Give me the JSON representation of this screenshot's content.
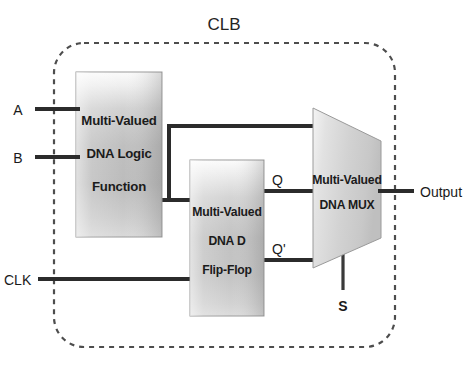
{
  "diagram": {
    "title": "CLB",
    "type": "block-diagram",
    "boundary": {
      "style": "dashed-rounded-rectangle",
      "label": "CLB"
    },
    "blocks": [
      {
        "id": "logic-function",
        "shape": "rectangle",
        "lines": [
          "Multi-Valued",
          "DNA Logic",
          "Function"
        ],
        "line1": "Multi-Valued",
        "line2": "DNA Logic",
        "line3": "Function"
      },
      {
        "id": "d-flip-flop",
        "shape": "rectangle",
        "lines": [
          "Multi-Valued",
          "DNA D",
          "Flip-Flop"
        ],
        "line1": "Multi-Valued",
        "line2": "DNA D",
        "line3": "Flip-Flop"
      },
      {
        "id": "dna-mux",
        "shape": "trapezoid",
        "lines": [
          "Multi-Valued",
          "DNA MUX"
        ],
        "line1": "Multi-Valued",
        "line2": "DNA MUX"
      }
    ],
    "signals": {
      "input_a": "A",
      "input_b": "B",
      "input_clk": "CLK",
      "ff_q": "Q",
      "ff_qbar": "Q'",
      "mux_select": "S",
      "output": "Output"
    },
    "colors": {
      "block_fill_light": "#f2f2f2",
      "block_fill_mid": "#c3c3c3",
      "block_fill_dark": "#b0b0b0",
      "wire": "#2b2b2b",
      "boundary": "#4d4d4d",
      "text": "#1b1b1b",
      "background": "#ffffff"
    }
  }
}
